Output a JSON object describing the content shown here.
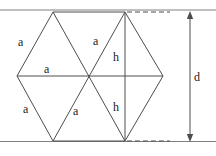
{
  "figure": {
    "type": "geometry-diagram",
    "canvas": {
      "width": 216,
      "height": 156,
      "background": "#ffffff"
    },
    "colors": {
      "stroke": "#4d4d4d",
      "rule": "#808080",
      "text": "#1a1a1a",
      "dashed": "#4d4d4d"
    },
    "labels": [
      {
        "id": "a-upper-left",
        "text": "a",
        "x": 18,
        "y": 36
      },
      {
        "id": "a-center-top",
        "text": "a",
        "x": 93,
        "y": 35
      },
      {
        "id": "a-middle",
        "text": "a",
        "x": 44,
        "y": 63
      },
      {
        "id": "a-lower-left",
        "text": "a",
        "x": 23,
        "y": 103
      },
      {
        "id": "a-lower-mid",
        "text": "a",
        "x": 73,
        "y": 105
      },
      {
        "id": "h-upper",
        "text": "h",
        "x": 113,
        "y": 51
      },
      {
        "id": "h-lower",
        "text": "h",
        "x": 113,
        "y": 101
      },
      {
        "id": "d-dimension",
        "text": "d",
        "x": 194,
        "y": 71
      }
    ],
    "hexagon": {
      "vertices": {
        "top_left": {
          "x": 53,
          "y": 12
        },
        "top_right": {
          "x": 125,
          "y": 12
        },
        "right": {
          "x": 163,
          "y": 76
        },
        "bottom_right": {
          "x": 125,
          "y": 141
        },
        "bottom_left": {
          "x": 53,
          "y": 141
        },
        "left": {
          "x": 17,
          "y": 76
        },
        "center": {
          "x": 89,
          "y": 76
        }
      }
    },
    "dimension": {
      "label": "d",
      "axis_x": 190,
      "top_y": 12,
      "bottom_y": 141,
      "style": "double-headed-arrow"
    },
    "guides": {
      "dashed_top": {
        "x1": 127,
        "y1": 12,
        "x2": 168,
        "y2": 12
      },
      "dashed_bottom": {
        "x1": 127,
        "y1": 141,
        "x2": 168,
        "y2": 141
      },
      "rule_top": {
        "x1": 0,
        "y1": 10,
        "x2": 216,
        "y2": 10
      },
      "rule_bottom": {
        "x1": 0,
        "y1": 141,
        "x2": 216,
        "y2": 141
      }
    }
  }
}
